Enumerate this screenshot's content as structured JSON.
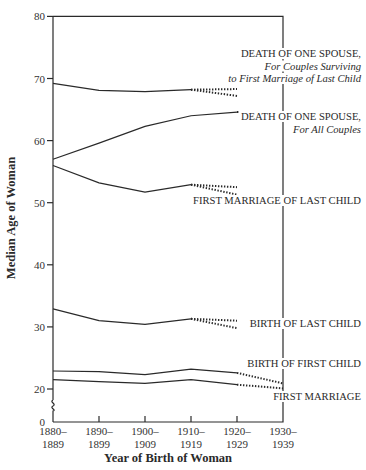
{
  "chart_data": {
    "type": "line",
    "title": "",
    "xlabel": "Year of Birth of Woman",
    "ylabel": "Median Age of Woman",
    "ylim": [
      0,
      80
    ],
    "y_axis_break": "between 0 and 20",
    "yticks": [
      0,
      20,
      30,
      40,
      50,
      60,
      70,
      80
    ],
    "categories": [
      "1880–1889",
      "1890–1899",
      "1900–1909",
      "1910–1919",
      "1920–1929",
      "1930–1939"
    ],
    "category_labels": [
      {
        "line1": "1880–",
        "line2": "1889"
      },
      {
        "line1": "1890–",
        "line2": "1899"
      },
      {
        "line1": "1900–",
        "line2": "1909"
      },
      {
        "line1": "1910–",
        "line2": "1919"
      },
      {
        "line1": "1920–",
        "line2": "1929"
      },
      {
        "line1": "1930–",
        "line2": "1939"
      }
    ],
    "grid": false,
    "legend_position": "direct labels at right of plot",
    "series": [
      {
        "name": "Death of One Spouse, For Couples Surviving to First Marriage of Last Child",
        "label_lines": [
          "DEATH OF ONE SPOUSE,",
          "For Couples Surviving",
          "to First Marriage of Last Child"
        ],
        "values": [
          69.2,
          68.1,
          67.9,
          68.2,
          null,
          null
        ],
        "projected_high": {
          "from": [
            3,
            68.2
          ],
          "to": [
            4,
            68.3
          ]
        },
        "projected_low": {
          "from": [
            3,
            68.2
          ],
          "to": [
            4,
            67.2
          ]
        }
      },
      {
        "name": "Death of One Spouse, For All Couples",
        "label_lines": [
          "DEATH OF ONE SPOUSE,",
          "For All Couples"
        ],
        "values": [
          57.0,
          59.6,
          62.3,
          64.0,
          64.6,
          null
        ],
        "projected": {
          "from": [
            4,
            64.6
          ],
          "to": [
            5,
            64.6
          ]
        }
      },
      {
        "name": "First Marriage of Last Child",
        "label_lines": [
          "FIRST MARRIAGE OF LAST CHILD"
        ],
        "values": [
          56.0,
          53.2,
          51.7,
          52.9,
          null,
          null
        ],
        "projected_high": {
          "from": [
            3,
            52.9
          ],
          "to": [
            4,
            52.5
          ]
        },
        "projected_low": {
          "from": [
            3,
            52.9
          ],
          "to": [
            4,
            51.3
          ]
        }
      },
      {
        "name": "Birth of Last Child",
        "label_lines": [
          "BIRTH OF LAST CHILD"
        ],
        "values": [
          32.9,
          31.0,
          30.4,
          31.3,
          null,
          null
        ],
        "projected_high": {
          "from": [
            3,
            31.3
          ],
          "to": [
            4,
            31.0
          ]
        },
        "projected_low": {
          "from": [
            3,
            31.3
          ],
          "to": [
            4,
            29.8
          ]
        }
      },
      {
        "name": "Birth of First Child",
        "label_lines": [
          "BIRTH OF FIRST CHILD"
        ],
        "values": [
          22.9,
          22.8,
          22.3,
          23.2,
          22.6,
          null
        ],
        "projected": {
          "from": [
            4,
            22.6
          ],
          "to": [
            5,
            20.9
          ]
        }
      },
      {
        "name": "First Marriage",
        "label_lines": [
          "FIRST MARRIAGE"
        ],
        "values": [
          21.5,
          21.2,
          20.9,
          21.5,
          20.7,
          null
        ],
        "projected": {
          "from": [
            4,
            20.7
          ],
          "to": [
            5,
            20.1
          ]
        }
      }
    ]
  }
}
